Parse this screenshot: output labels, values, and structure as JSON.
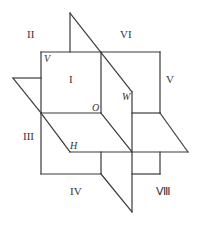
{
  "diagram": {
    "planes": [
      {
        "name": "V",
        "label": "V"
      },
      {
        "name": "W",
        "label": "W"
      },
      {
        "name": "H",
        "label": "H"
      }
    ],
    "origin_label": "O",
    "octants": [
      {
        "id": "I",
        "label": "I"
      },
      {
        "id": "II",
        "label": "II"
      },
      {
        "id": "III",
        "label": "III"
      },
      {
        "id": "IV",
        "label": "IV"
      },
      {
        "id": "V",
        "label": "V"
      },
      {
        "id": "VI",
        "label": "VI"
      },
      {
        "id": "VII",
        "label": "Ⅶ"
      },
      {
        "id": "VIII",
        "label": "Ⅷ"
      }
    ],
    "line_color": "#3a3a3a",
    "background": "#ffffff"
  }
}
